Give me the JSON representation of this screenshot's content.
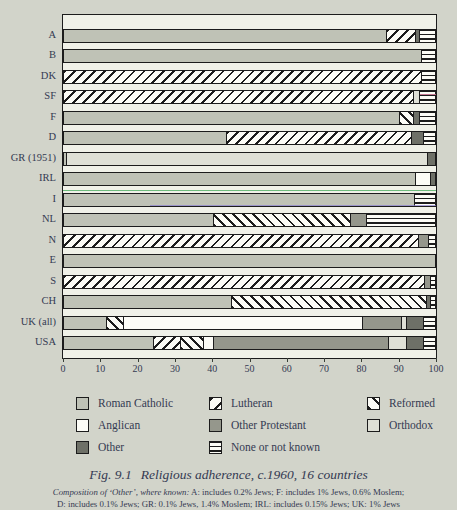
{
  "figure": {
    "fig_label": "Fig. 9.1",
    "title": "Religious adherence, c.1960, 16 countries",
    "note_italic": "Composition of ‘Other’, where known:",
    "note_rest": " A: includes 0.2% Jews; F: includes 1% Jews, 0.6% Moslem;",
    "note_line2": "D: includes 0.1% Jews; GR: 0.1% Jews, 1.4% Moslem; IRL: includes 0.15% Jews; UK: 1% Jews"
  },
  "chart_data": {
    "type": "bar",
    "orientation": "horizontal",
    "stacked": true,
    "unit": "percent of population",
    "xlim": [
      0,
      100
    ],
    "x_ticks": [
      0,
      10,
      20,
      30,
      40,
      50,
      60,
      70,
      80,
      90,
      100
    ],
    "grid": false,
    "legend_position": "bottom",
    "categories": [
      "A",
      "B",
      "DK",
      "SF",
      "F",
      "D",
      "GR (1951)",
      "IRL",
      "I",
      "NL",
      "N",
      "E",
      "S",
      "CH",
      "UK (all)",
      "USA"
    ],
    "series": [
      {
        "name": "Roman Catholic",
        "key": "roman_catholic",
        "pattern": "solid-gray",
        "values": [
          87.5,
          96.5,
          0,
          0,
          91,
          44,
          0.5,
          95,
          94.5,
          40.5,
          0,
          100,
          0,
          45.5,
          11.5,
          24.5
        ]
      },
      {
        "name": "Lutheran",
        "key": "lutheran",
        "pattern": "diagonal-hatch",
        "values": [
          7.5,
          0,
          96.5,
          94.5,
          0,
          50,
          0,
          0,
          0,
          0,
          96,
          0,
          97.5,
          0,
          0,
          7
        ]
      },
      {
        "name": "Reformed",
        "key": "reformed",
        "pattern": "back-diagonal-hatch",
        "values": [
          0,
          0,
          0,
          0,
          3.5,
          0,
          0,
          0,
          0,
          37,
          0,
          0,
          0,
          52.5,
          4.5,
          6
        ]
      },
      {
        "name": "Anglican",
        "key": "anglican",
        "pattern": "solid-white",
        "values": [
          0,
          0,
          0,
          0,
          0,
          0,
          0,
          4,
          0,
          0,
          0,
          0,
          0,
          0,
          65,
          2.5
        ]
      },
      {
        "name": "Other Protestant",
        "key": "other_protestant",
        "pattern": "solid-medium-gray",
        "values": [
          0,
          0,
          0,
          0,
          0,
          0,
          0,
          0,
          0,
          4,
          2.5,
          0,
          1.5,
          0,
          10.5,
          48
        ]
      },
      {
        "name": "Orthodox",
        "key": "orthodox",
        "pattern": "solid-light-gray",
        "values": [
          0,
          0,
          0,
          1.5,
          0,
          0,
          97.5,
          0,
          0,
          0,
          0,
          0,
          0,
          0,
          1,
          4.5
        ]
      },
      {
        "name": "Other",
        "key": "other",
        "pattern": "solid-dark-gray",
        "values": [
          1,
          0,
          0,
          0,
          1.5,
          3,
          2,
          1,
          0,
          0,
          0,
          0,
          0,
          1,
          4.5,
          4.5
        ]
      },
      {
        "name": "None or not known",
        "key": "none_or_not_known",
        "pattern": "horizontal-lines",
        "values": [
          4,
          3.5,
          3.5,
          4,
          4,
          3,
          0,
          0,
          5.5,
          18.5,
          1.5,
          0,
          1,
          1,
          3,
          3
        ]
      }
    ]
  },
  "colors": {
    "page_bg": "#d2d4ca",
    "plot_bg": "#f0f1e8",
    "frame": "#1c1c1c",
    "text": "#343a52",
    "roman_catholic": "#bfc2b6",
    "anglican": "#fcfcf6",
    "other_protestant": "#95978c",
    "orthodox": "#dfe0d6",
    "other": "#6e7067",
    "hatch_bg": "#fcfcf6",
    "hatch_line": "#1c1c1c"
  }
}
